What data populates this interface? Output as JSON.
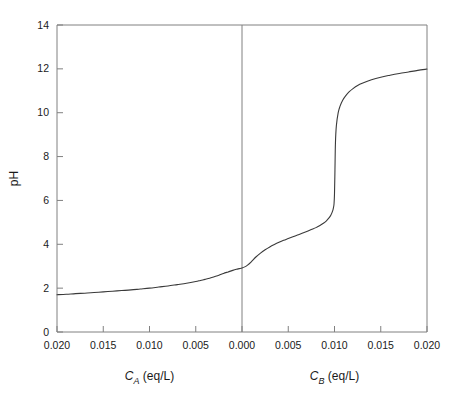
{
  "chart_data": {
    "type": "line",
    "title": "",
    "subtitle": "",
    "ylabel": "pH",
    "ylim": [
      0,
      14
    ],
    "yticks": [
      0,
      2,
      4,
      6,
      8,
      10,
      12,
      14
    ],
    "ytick_labels": [
      "0",
      "2",
      "4",
      "6",
      "8",
      "10",
      "12",
      "14"
    ],
    "grid": false,
    "legend": "none",
    "axis_color": "#808080",
    "curve_color": "#3a3a3a",
    "background": "#ffffff",
    "xlabel_left": "C_A (eq/L)",
    "xlabel_right": "C_B (eq/L)",
    "xlabel_left_parts": {
      "var": "C",
      "sub": "A",
      "rest": " (eq/L)"
    },
    "xlabel_right_parts": {
      "var": "C",
      "sub": "B",
      "rest": " (eq/L)"
    },
    "xtick_labels": [
      "0.020",
      "0.015",
      "0.010",
      "0.005",
      "0.000",
      "0.005",
      "0.010",
      "0.015",
      "0.020"
    ],
    "xtick_values": [
      -0.02,
      -0.015,
      -0.01,
      -0.005,
      0.0,
      0.005,
      0.01,
      0.015,
      0.02
    ],
    "center_divider_at": 0.0,
    "x": [
      -0.02,
      -0.019,
      -0.018,
      -0.017,
      -0.016,
      -0.015,
      -0.014,
      -0.013,
      -0.012,
      -0.011,
      -0.01,
      -0.009,
      -0.008,
      -0.007,
      -0.006,
      -0.005,
      -0.0045,
      -0.004,
      -0.0035,
      -0.003,
      -0.0025,
      -0.002,
      -0.0015,
      -0.001,
      -0.0006,
      -0.0003,
      0.0,
      0.0003,
      0.0006,
      0.001,
      0.0015,
      0.002,
      0.0025,
      0.003,
      0.0035,
      0.004,
      0.0045,
      0.005,
      0.0055,
      0.006,
      0.0065,
      0.007,
      0.0075,
      0.008,
      0.0085,
      0.0088,
      0.0091,
      0.0094,
      0.0096,
      0.0098,
      0.0099,
      0.00995,
      0.01,
      0.01005,
      0.0101,
      0.0102,
      0.0104,
      0.0106,
      0.0109,
      0.0112,
      0.0116,
      0.012,
      0.0125,
      0.013,
      0.014,
      0.015,
      0.016,
      0.017,
      0.018,
      0.019,
      0.02
    ],
    "y": [
      1.7,
      1.72,
      1.75,
      1.77,
      1.8,
      1.83,
      1.86,
      1.89,
      1.92,
      1.96,
      2.0,
      2.05,
      2.1,
      2.16,
      2.22,
      2.3,
      2.35,
      2.4,
      2.45,
      2.52,
      2.59,
      2.67,
      2.74,
      2.81,
      2.86,
      2.89,
      2.92,
      2.97,
      3.05,
      3.2,
      3.42,
      3.6,
      3.75,
      3.88,
      3.99,
      4.09,
      4.18,
      4.26,
      4.34,
      4.42,
      4.5,
      4.58,
      4.67,
      4.76,
      4.88,
      4.96,
      5.06,
      5.2,
      5.32,
      5.52,
      5.7,
      5.85,
      6.3,
      7.4,
      8.6,
      9.4,
      10.0,
      10.3,
      10.58,
      10.77,
      10.96,
      11.1,
      11.24,
      11.34,
      11.5,
      11.62,
      11.71,
      11.79,
      11.86,
      11.93,
      11.99
    ],
    "annotations": [
      {
        "text": "equivalence point",
        "x": 0.01,
        "y": 7.0,
        "visible": false
      }
    ]
  },
  "geometry": {
    "plot_left": 57,
    "plot_right": 427,
    "plot_top": 25,
    "plot_bottom": 332
  }
}
